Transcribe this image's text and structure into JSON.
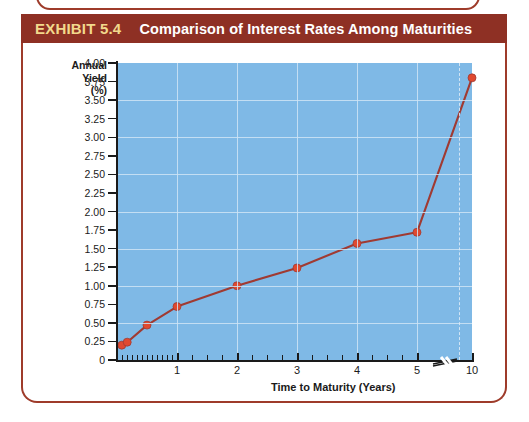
{
  "exhibit": {
    "number_label": "EXHIBIT 5.4",
    "title": "Comparison of Interest Rates Among Maturities"
  },
  "colors": {
    "header_bg": "#8e3024",
    "header_number_text": "#f2d98c",
    "header_title_text": "#ffffff",
    "panel_border": "#9e3b2a",
    "plot_bg": "#7fb9e6",
    "gridline": "#cfe4f5",
    "series_line": "#a03a32",
    "series_marker": "#e0492f",
    "axis": "#1a1a1a"
  },
  "chart_data": {
    "type": "line",
    "title": "Comparison of Interest Rates Among Maturities",
    "xlabel": "Time to Maturity (Years)",
    "ylabel": "Annual Yield (%)",
    "ylabel_lines": [
      "Annual",
      "Yield",
      "(%)"
    ],
    "xlim": [
      0,
      10
    ],
    "ylim": [
      0,
      4.0
    ],
    "grid": true,
    "legend": "none",
    "axis_break": {
      "present": true,
      "between": [
        5,
        10
      ],
      "symbol": "double-slash"
    },
    "ytick_labels": [
      "4.00",
      "3.75",
      "3.50",
      "3.25",
      "3.00",
      "2.75",
      "2.50",
      "2.25",
      "2.00",
      "1.75",
      "1.50",
      "1.25",
      "1.00",
      "0.75",
      "0.50",
      "0.25",
      "0"
    ],
    "ytick_values": [
      4.0,
      3.75,
      3.5,
      3.25,
      3.0,
      2.75,
      2.5,
      2.25,
      2.0,
      1.75,
      1.5,
      1.25,
      1.0,
      0.75,
      0.5,
      0.25,
      0
    ],
    "xtick_labels": [
      "1",
      "2",
      "3",
      "4",
      "5",
      "10"
    ],
    "xtick_values": [
      1,
      2,
      3,
      4,
      5,
      10
    ],
    "x": [
      0.08,
      0.17,
      0.5,
      1,
      2,
      3,
      4,
      5,
      10
    ],
    "values": [
      0.2,
      0.24,
      0.47,
      0.72,
      1.0,
      1.24,
      1.57,
      1.72,
      3.8
    ],
    "points": [
      {
        "x": 0.08,
        "y": 0.2
      },
      {
        "x": 0.17,
        "y": 0.24
      },
      {
        "x": 0.5,
        "y": 0.47
      },
      {
        "x": 1,
        "y": 0.72
      },
      {
        "x": 2,
        "y": 1.0
      },
      {
        "x": 3,
        "y": 1.24
      },
      {
        "x": 4,
        "y": 1.57
      },
      {
        "x": 5,
        "y": 1.72
      },
      {
        "x": 10,
        "y": 3.8
      }
    ],
    "series": [
      {
        "name": "Yield curve",
        "values": [
          0.2,
          0.24,
          0.47,
          0.72,
          1.0,
          1.24,
          1.57,
          1.72,
          3.8
        ]
      }
    ]
  }
}
